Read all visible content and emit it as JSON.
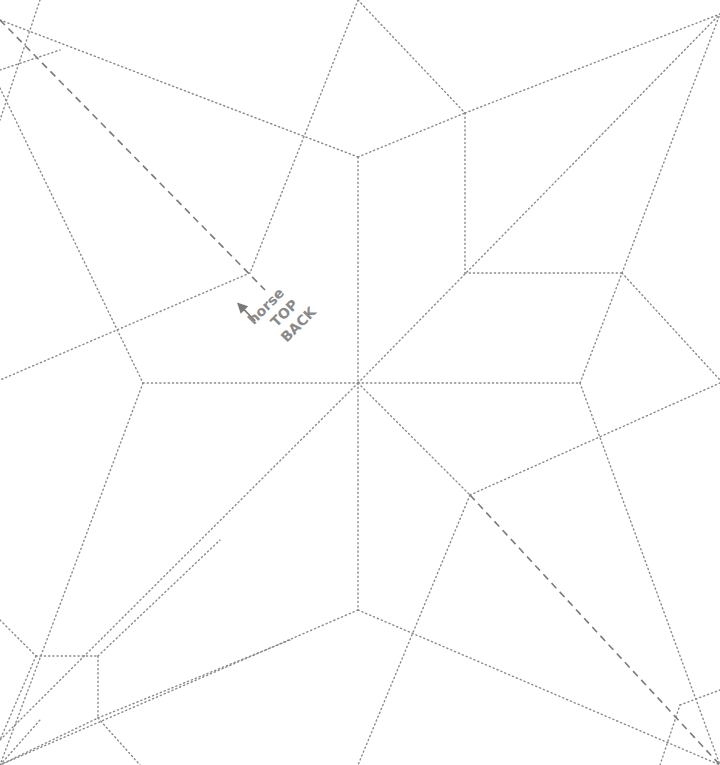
{
  "diagram": {
    "kind": "origami crease pattern",
    "line_color": "#8a8a8a",
    "background": "#ffffff",
    "labels": {
      "line1": "horse",
      "line2": "TOP",
      "line3": "BACK"
    },
    "line_types": [
      "valley (dotted)",
      "mountain (dashed)"
    ]
  }
}
